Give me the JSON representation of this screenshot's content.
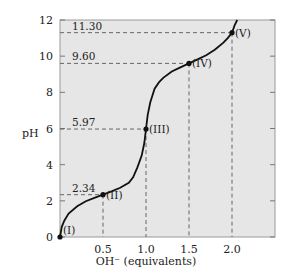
{
  "chart_data": {
    "type": "line",
    "title": "",
    "xlabel": "OH⁻ (equivalents)",
    "ylabel": "pH",
    "xlim": [
      0,
      2.5
    ],
    "ylim": [
      0,
      12
    ],
    "x_ticks": [
      "0.5",
      "1.0",
      "1.5",
      "2.0"
    ],
    "y_ticks": [
      "0",
      "2",
      "4",
      "6",
      "8",
      "10",
      "12"
    ],
    "grid": false,
    "background_color": "#e6e6e6",
    "line_color": "#111111",
    "points": [
      {
        "label": "(I)",
        "x": 0.0,
        "y": 0.0
      },
      {
        "label": "(II)",
        "x": 0.5,
        "y": 2.34
      },
      {
        "label": "(III)",
        "x": 1.0,
        "y": 5.97
      },
      {
        "label": "(IV)",
        "x": 1.5,
        "y": 9.6
      },
      {
        "label": "(V)",
        "x": 2.0,
        "y": 11.3
      }
    ],
    "annotations": [
      {
        "text": "2.34",
        "y": 2.34
      },
      {
        "text": "5.97",
        "y": 5.97
      },
      {
        "text": "9.60",
        "y": 9.6
      },
      {
        "text": "11.30",
        "y": 11.3
      }
    ],
    "series": [
      {
        "name": "titration curve",
        "x": [
          0.0,
          0.02,
          0.05,
          0.1,
          0.2,
          0.3,
          0.4,
          0.5,
          0.6,
          0.7,
          0.8,
          0.85,
          0.9,
          0.95,
          0.98,
          1.0,
          1.02,
          1.05,
          1.1,
          1.15,
          1.2,
          1.3,
          1.4,
          1.5,
          1.6,
          1.7,
          1.8,
          1.9,
          1.95,
          2.0,
          2.03,
          2.06
        ],
        "y": [
          0.0,
          0.55,
          0.9,
          1.3,
          1.7,
          1.98,
          2.17,
          2.34,
          2.52,
          2.72,
          3.0,
          3.3,
          3.85,
          4.5,
          5.2,
          5.97,
          6.75,
          7.45,
          8.2,
          8.55,
          8.8,
          9.15,
          9.38,
          9.6,
          9.82,
          10.05,
          10.35,
          10.75,
          11.0,
          11.3,
          11.7,
          12.0
        ]
      }
    ]
  }
}
